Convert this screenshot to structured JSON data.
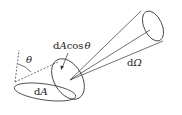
{
  "diagram": {
    "labels": {
      "projected_area": "dAcosθ",
      "projected_area_parts": [
        "d",
        "A",
        "cos",
        "θ"
      ],
      "area": "dA",
      "area_parts": [
        "d",
        "A"
      ],
      "solid_angle": "dΩ",
      "solid_angle_parts": [
        "d",
        "Ω"
      ],
      "angle": "θ"
    },
    "colors": {
      "stroke": "#333333",
      "text": "#222222",
      "background": "#ffffff"
    }
  }
}
